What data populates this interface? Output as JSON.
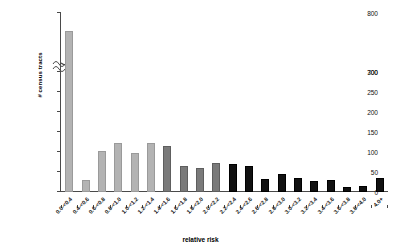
{
  "chart_data": {
    "type": "bar",
    "title": "",
    "xlabel": "relative risk",
    "ylabel": "# census tracts",
    "ylim": [
      0,
      800
    ],
    "y_axis_break": {
      "from": 300,
      "to": 700
    },
    "grid": false,
    "legend": null,
    "ytick_labels": [
      "0",
      "50",
      "100",
      "150",
      "200",
      "250",
      "300",
      "700",
      "800"
    ],
    "categories": [
      "0.0-<0.4",
      "0.4-<0.6",
      "0.6-<0.8",
      "0.8-<1.0",
      "1.0-<1.2",
      "1.2-<1.4",
      "1.4-<1.6",
      "1.6-<1.8",
      "1.8-<2.0",
      "2.0-<2.2",
      "2.2-<2.4",
      "2.4-<2.6",
      "2.6-<2.8",
      "2.8-<3.0",
      "3.0-<3.2",
      "3.2-<3.4",
      "3.4-<3.6",
      "3.6-<3.8",
      "3.8-<4.0",
      "4.0+"
    ],
    "values": [
      750,
      30,
      103,
      123,
      97,
      122,
      116,
      64,
      60,
      72,
      70,
      64,
      32,
      45,
      35,
      28,
      30,
      12,
      14,
      35
    ],
    "bar_shades": [
      "light",
      "light",
      "light",
      "light",
      "light",
      "light",
      "mid",
      "mid",
      "mid",
      "mid",
      "dark",
      "dark",
      "dark",
      "dark",
      "dark",
      "dark",
      "dark",
      "dark",
      "dark",
      "dark"
    ]
  },
  "colors": {
    "light": "#b3b3b3",
    "mid": "#7a7a7a",
    "dark": "#111111",
    "axis": "#4a4a4a",
    "text": "#111111",
    "background": "#ffffff"
  }
}
